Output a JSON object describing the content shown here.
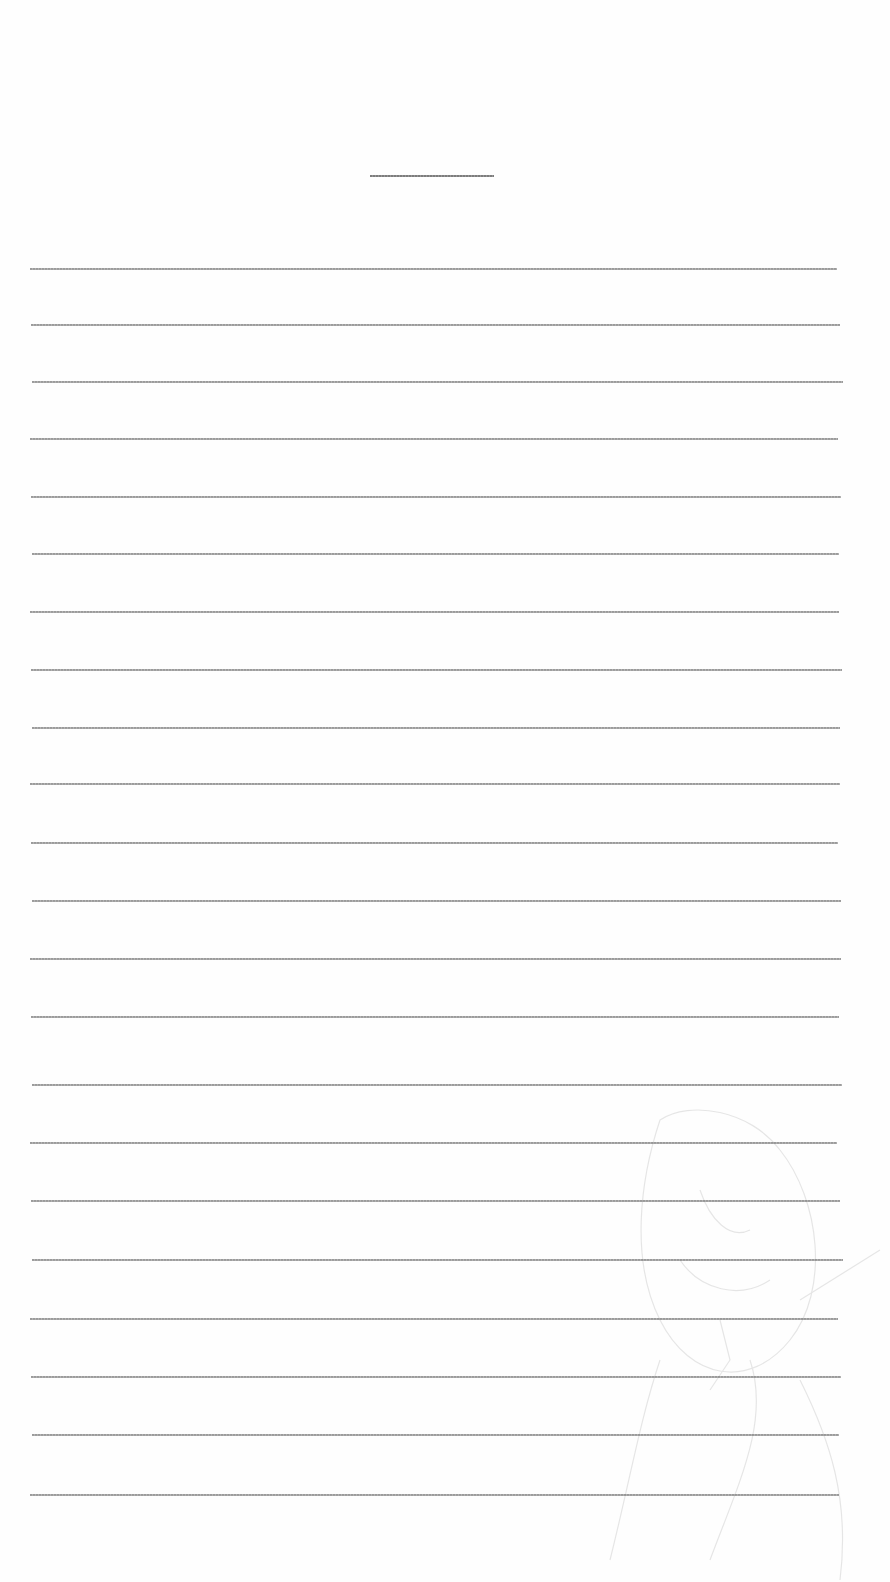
{
  "document": {
    "type": "lined-paper",
    "title": "",
    "title_underline": {
      "x": 370,
      "y": 175,
      "width": 124
    },
    "ruled_lines": {
      "count": 22,
      "left": 31,
      "right": 840,
      "positions_y": [
        268,
        324,
        381,
        438,
        496,
        553,
        611,
        669,
        727,
        783,
        842,
        900,
        958,
        1016,
        1084,
        1142,
        1200,
        1259,
        1318,
        1376,
        1434,
        1494
      ],
      "color": "#9a9a9a"
    },
    "lines_text": [
      "",
      "",
      "",
      "",
      "",
      "",
      "",
      "",
      "",
      "",
      "",
      "",
      "",
      "",
      "",
      "",
      "",
      "",
      "",
      "",
      "",
      ""
    ],
    "background_color": "#fefefe",
    "bleed_through": "faint-sketch-lower-right"
  }
}
